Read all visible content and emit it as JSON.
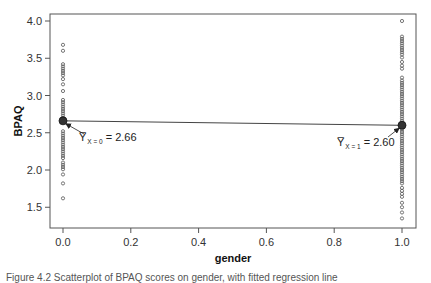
{
  "chart_data": {
    "type": "scatter",
    "title": "",
    "xlabel": "gender",
    "ylabel": "BPAQ",
    "xlim": [
      -0.04,
      1.04
    ],
    "ylim": [
      1.25,
      4.1
    ],
    "xticks": [
      0.0,
      0.2,
      0.4,
      0.6,
      0.8,
      1.0
    ],
    "xtick_labels": [
      "0.0",
      "0.2",
      "0.4",
      "0.6",
      "0.8",
      "1.0"
    ],
    "yticks": [
      1.5,
      2.0,
      2.5,
      3.0,
      3.5,
      4.0
    ],
    "ytick_labels": [
      "1.5",
      "2.0",
      "2.5",
      "3.0",
      "3.5",
      "4.0"
    ],
    "grid": false,
    "legend": null,
    "series": [
      {
        "name": "gender = 0",
        "x": 0.0,
        "y": [
          3.68,
          3.6,
          3.42,
          3.39,
          3.36,
          3.33,
          3.3,
          3.27,
          3.22,
          3.15,
          3.06,
          2.94,
          2.91,
          2.88,
          2.85,
          2.82,
          2.79,
          2.76,
          2.73,
          2.7,
          2.68,
          2.52,
          2.49,
          2.46,
          2.43,
          2.4,
          2.37,
          2.34,
          2.31,
          2.28,
          2.25,
          2.22,
          2.19,
          2.16,
          2.1,
          2.07,
          2.04,
          2.01,
          1.94,
          1.82,
          1.62
        ]
      },
      {
        "name": "gender = 1",
        "x": 1.0,
        "y": [
          4.0,
          3.79,
          3.76,
          3.73,
          3.7,
          3.67,
          3.64,
          3.61,
          3.58,
          3.55,
          3.51,
          3.45,
          3.4,
          3.36,
          3.24,
          3.2,
          3.17,
          3.14,
          3.11,
          3.08,
          3.05,
          3.02,
          2.99,
          2.96,
          2.93,
          2.9,
          2.87,
          2.84,
          2.81,
          2.78,
          2.75,
          2.72,
          2.69,
          2.66,
          2.63,
          2.57,
          2.54,
          2.51,
          2.48,
          2.45,
          2.42,
          2.39,
          2.36,
          2.33,
          2.3,
          2.27,
          2.24,
          2.21,
          2.18,
          2.15,
          2.12,
          2.09,
          2.06,
          2.03,
          2.0,
          1.97,
          1.94,
          1.91,
          1.88,
          1.85,
          1.82,
          1.76,
          1.72,
          1.68,
          1.64,
          1.56,
          1.5,
          1.43,
          1.35
        ]
      }
    ],
    "means": [
      {
        "x": 0.0,
        "y": 2.66,
        "label_symbol": "Y̅",
        "label_subscript": "X = 0",
        "label_value": "= 2.66"
      },
      {
        "x": 1.0,
        "y": 2.6,
        "label_symbol": "Y̅",
        "label_subscript": "X = 1",
        "label_value": "= 2.60"
      }
    ],
    "regression_line": {
      "from": [
        0.0,
        2.66
      ],
      "to": [
        1.0,
        2.6
      ]
    }
  },
  "colors": {
    "frame": "#555555",
    "points": "#555555",
    "mean_fill": "#333333",
    "line": "#444444"
  },
  "caption": "Figure 4.2   Scatterplot of BPAQ scores on gender, with fitted regression line"
}
